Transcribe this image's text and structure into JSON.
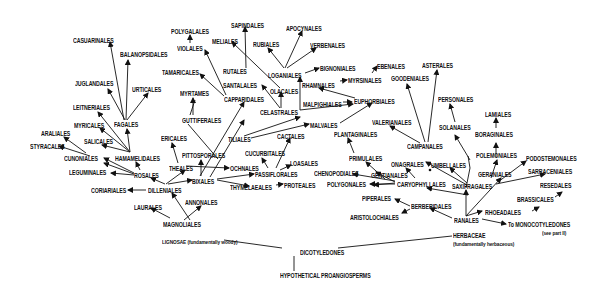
{
  "diagram": {
    "title": "",
    "root": "HYPOTHETICAL PROANGIOSPERMS",
    "ink_color": "#111111",
    "background": "#ffffff",
    "nodes": [
      {
        "id": "casuarinales",
        "label": "CASUARINALES",
        "x": 73,
        "y": 37
      },
      {
        "id": "balanopsidales",
        "label": "BALANOPSIDALES",
        "x": 120,
        "y": 51
      },
      {
        "id": "juglandales",
        "label": "JUGLANDALES",
        "x": 75,
        "y": 80
      },
      {
        "id": "urticales",
        "label": "URTICALES",
        "x": 132,
        "y": 86
      },
      {
        "id": "leitneriales",
        "label": "LEITNERIALES",
        "x": 73,
        "y": 104
      },
      {
        "id": "myricales",
        "label": "MYRICALES",
        "x": 74,
        "y": 122
      },
      {
        "id": "fagales",
        "label": "FAGALES",
        "x": 114,
        "y": 121
      },
      {
        "id": "araliales",
        "label": "ARALIALES",
        "x": 41,
        "y": 130
      },
      {
        "id": "styracales",
        "label": "STYRACALES",
        "x": 30,
        "y": 143
      },
      {
        "id": "salicales",
        "label": "SALICALES",
        "x": 84,
        "y": 138
      },
      {
        "id": "cunoniales",
        "label": "CUNONIALES",
        "x": 64,
        "y": 155
      },
      {
        "id": "hamamelidales",
        "label": "HAMAMELIDALES",
        "x": 115,
        "y": 155
      },
      {
        "id": "leguminales",
        "label": "LEGUMINALES",
        "x": 69,
        "y": 169
      },
      {
        "id": "rosales",
        "label": "ROSALES",
        "x": 134,
        "y": 172
      },
      {
        "id": "coriariales",
        "label": "CORIARIALES",
        "x": 91,
        "y": 187
      },
      {
        "id": "dilleniales",
        "label": "DILLENIALES",
        "x": 148,
        "y": 187
      },
      {
        "id": "laurales",
        "label": "LAURALES",
        "x": 134,
        "y": 204
      },
      {
        "id": "magnoliales",
        "label": "MAGNOLIALES",
        "x": 163,
        "y": 221
      },
      {
        "id": "annonales",
        "label": "ANNONALES",
        "x": 185,
        "y": 199
      },
      {
        "id": "ericales",
        "label": "ERICALES",
        "x": 161,
        "y": 135
      },
      {
        "id": "theales",
        "label": "THEALES",
        "x": 169,
        "y": 165
      },
      {
        "id": "pittosporales",
        "label": "PITTOSPORALES",
        "x": 182,
        "y": 152
      },
      {
        "id": "bixales",
        "label": "BIXALES",
        "x": 192,
        "y": 178
      },
      {
        "id": "guttiferales",
        "label": "GUTTIFERALES",
        "x": 182,
        "y": 117
      },
      {
        "id": "myrtames",
        "label": "MYRTAMES",
        "x": 180,
        "y": 90
      },
      {
        "id": "tamaricales",
        "label": "TAMARICALES",
        "x": 162,
        "y": 69
      },
      {
        "id": "violales",
        "label": "VIOLALES",
        "x": 177,
        "y": 45
      },
      {
        "id": "polygalales",
        "label": "POLYGALALES",
        "x": 171,
        "y": 28
      },
      {
        "id": "capparidales",
        "label": "CAPPARIDALES",
        "x": 224,
        "y": 96
      },
      {
        "id": "rutales",
        "label": "RUTALES",
        "x": 223,
        "y": 68
      },
      {
        "id": "meliales",
        "label": "MELIALES",
        "x": 212,
        "y": 38
      },
      {
        "id": "sapindales",
        "label": "SAPINDALES",
        "x": 231,
        "y": 22
      },
      {
        "id": "santalales",
        "label": "SANTALALES",
        "x": 223,
        "y": 82
      },
      {
        "id": "tiliales",
        "label": "TILIALES",
        "x": 228,
        "y": 136
      },
      {
        "id": "ochnales",
        "label": "OCHNALES",
        "x": 230,
        "y": 165
      },
      {
        "id": "cucurbitales",
        "label": "CUCURBITALES",
        "x": 245,
        "y": 150
      },
      {
        "id": "passiflorales",
        "label": "PASSIFLORALES",
        "x": 255,
        "y": 171
      },
      {
        "id": "thymelaeales",
        "label": "THYMELAEALES",
        "x": 230,
        "y": 184
      },
      {
        "id": "proteales",
        "label": "PROTEALES",
        "x": 284,
        "y": 182
      },
      {
        "id": "loasales",
        "label": "LOASALES",
        "x": 290,
        "y": 160
      },
      {
        "id": "cactales",
        "label": "CACTALES",
        "x": 277,
        "y": 133
      },
      {
        "id": "celastrales",
        "label": "CELASTRALES",
        "x": 260,
        "y": 109
      },
      {
        "id": "olacales",
        "label": "OLACALES",
        "x": 270,
        "y": 88
      },
      {
        "id": "loganiales",
        "label": "LOGANIALES",
        "x": 268,
        "y": 72
      },
      {
        "id": "rubiales",
        "label": "RUBIALES",
        "x": 253,
        "y": 41
      },
      {
        "id": "apocynales",
        "label": "APOCYNALES",
        "x": 286,
        "y": 25
      },
      {
        "id": "verbenales",
        "label": "VERBENALES",
        "x": 310,
        "y": 42
      },
      {
        "id": "bignoniales",
        "label": "BIGNONIALES",
        "x": 320,
        "y": 65
      },
      {
        "id": "rhamnales",
        "label": "RHAMNALES",
        "x": 302,
        "y": 82
      },
      {
        "id": "myrsinales",
        "label": "MYRSINALES",
        "x": 348,
        "y": 77
      },
      {
        "id": "malpighiales",
        "label": "MALPIGHIALES",
        "x": 303,
        "y": 101
      },
      {
        "id": "euphorbiales",
        "label": "EUPHORBIALES",
        "x": 354,
        "y": 98
      },
      {
        "id": "malvales",
        "label": "MALVALES",
        "x": 310,
        "y": 122
      },
      {
        "id": "ebenales",
        "label": "EBENALES",
        "x": 377,
        "y": 63
      },
      {
        "id": "goodeniales",
        "label": "GOODENIALES",
        "x": 391,
        "y": 75
      },
      {
        "id": "asterales",
        "label": "ASTERALES",
        "x": 422,
        "y": 62
      },
      {
        "id": "valerianales",
        "label": "VALERIANALES",
        "x": 372,
        "y": 119
      },
      {
        "id": "plantaginales",
        "label": "PLANTAGINALES",
        "x": 334,
        "y": 131
      },
      {
        "id": "campanales",
        "label": "CAMPANALES",
        "x": 407,
        "y": 143
      },
      {
        "id": "personales",
        "label": "PERSONALES",
        "x": 438,
        "y": 96
      },
      {
        "id": "solanales",
        "label": "SOLANALES",
        "x": 439,
        "y": 124
      },
      {
        "id": "lamiales",
        "label": "LAMIALES",
        "x": 485,
        "y": 111
      },
      {
        "id": "boraginales",
        "label": "BORAGINALES",
        "x": 475,
        "y": 131
      },
      {
        "id": "polemoniales",
        "label": "POLEMONIALES",
        "x": 476,
        "y": 152
      },
      {
        "id": "geraniales",
        "label": "GERANIALES",
        "x": 478,
        "y": 171
      },
      {
        "id": "podostemonales",
        "label": "PODOSTEMONALES",
        "x": 526,
        "y": 155
      },
      {
        "id": "sarraceniales",
        "label": "SARRACENIALES",
        "x": 528,
        "y": 168
      },
      {
        "id": "resedales",
        "label": "RESEDALES",
        "x": 540,
        "y": 182
      },
      {
        "id": "brassicales",
        "label": "BRASSICALES",
        "x": 517,
        "y": 196
      },
      {
        "id": "rheadales",
        "label": "RHOEADALES",
        "x": 485,
        "y": 209
      },
      {
        "id": "saxifragales",
        "label": "SAXIFRAGALES",
        "x": 452,
        "y": 183
      },
      {
        "id": "umbellales",
        "label": "UMBELLALES",
        "x": 431,
        "y": 162
      },
      {
        "id": "onagrales",
        "label": "ONAGRALES",
        "x": 391,
        "y": 161
      },
      {
        "id": "primulales",
        "label": "PRIMULALES",
        "x": 349,
        "y": 155
      },
      {
        "id": "chenopodiales",
        "label": "CHENOPODIALES",
        "x": 314,
        "y": 170
      },
      {
        "id": "gentianales",
        "label": "GENTIANALES",
        "x": 371,
        "y": 172
      },
      {
        "id": "polygonales",
        "label": "POLYGONALES",
        "x": 327,
        "y": 181
      },
      {
        "id": "caryophyllales",
        "label": "CARYOPHYLLALES",
        "x": 397,
        "y": 181
      },
      {
        "id": "piperales",
        "label": "PIPERALES",
        "x": 362,
        "y": 195
      },
      {
        "id": "berberidales",
        "label": "BERBERIDALES",
        "x": 411,
        "y": 203
      },
      {
        "id": "aristolochiales",
        "label": "ARISTOLOCHIALES",
        "x": 350,
        "y": 214
      },
      {
        "id": "ranales",
        "label": "RANALES",
        "x": 454,
        "y": 217
      },
      {
        "id": "to_monocots",
        "label": "To MONOCOTYLEDONES",
        "x": 508,
        "y": 221
      },
      {
        "id": "see_part",
        "label": "(see part II)",
        "x": 542,
        "y": 230
      },
      {
        "id": "herbaceae",
        "label": "HERBACEAE",
        "x": 453,
        "y": 232
      },
      {
        "id": "herbaceae_note",
        "label": "(fundamentally herbaceous)",
        "x": 453,
        "y": 241
      },
      {
        "id": "lignosae",
        "label": "LIGNOSAE (fundamentally woody)",
        "x": 162,
        "y": 239
      },
      {
        "id": "dicotyledones",
        "label": "DICOTYLEDONES",
        "x": 300,
        "y": 249
      },
      {
        "id": "proangiosperms",
        "label": "HYPOTHETICAL PROANGIOSPERMS",
        "x": 280,
        "y": 272
      }
    ],
    "edges": [
      [
        "proangiosperms_top",
        "dicot_bottom",
        "line"
      ],
      [
        "dicot_left",
        "lignosae_end",
        "line"
      ],
      [
        "dicot_right",
        "herbaceae_start",
        "line"
      ]
    ],
    "dot_marker": {
      "x": 430,
      "y": 170
    }
  }
}
